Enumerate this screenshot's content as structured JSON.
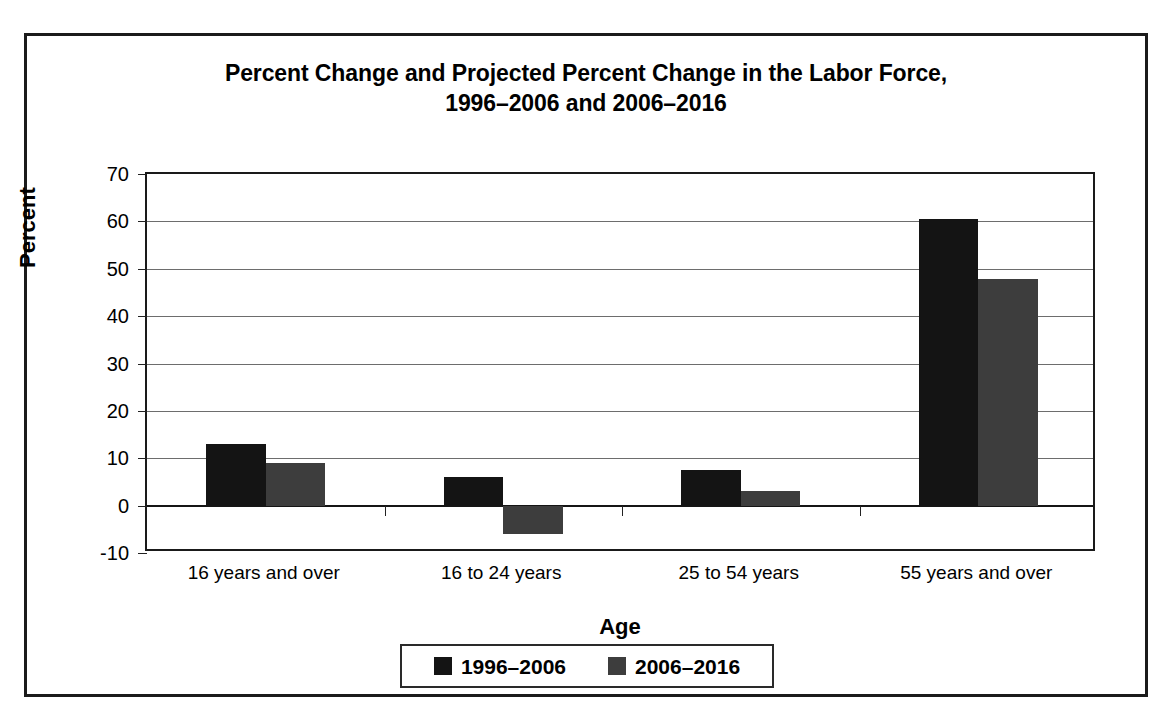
{
  "chart_data": {
    "type": "bar",
    "title": "Percent Change and Projected Percent Change in the Labor Force, 1996–2006 and 2006–2016",
    "title_line1": "Percent Change and Projected Percent Change in the Labor Force,",
    "title_line2": "1996–2006 and 2006–2016",
    "xlabel": "Age",
    "ylabel": "Percent",
    "categories": [
      "16 years and over",
      "16 to 24 years",
      "25 to 54 years",
      "55 years and over"
    ],
    "series": [
      {
        "name": "1996–2006",
        "color": "#141414",
        "values": [
          13.0,
          6.0,
          7.5,
          60.5
        ]
      },
      {
        "name": "2006–2016",
        "color": "#3d3d3d",
        "values": [
          9.0,
          -6.0,
          3.0,
          47.8
        ]
      }
    ],
    "ylim": [
      -10,
      70
    ],
    "ytick_labels": [
      "70",
      "60",
      "50",
      "40",
      "30",
      "20",
      "10",
      "0",
      "-10"
    ],
    "ytick_values": [
      70,
      60,
      50,
      40,
      30,
      20,
      10,
      0,
      -10
    ],
    "grid": true,
    "grid_axis": "y",
    "legend_position": "bottom"
  }
}
